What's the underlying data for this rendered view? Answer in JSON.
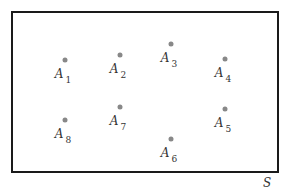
{
  "diagram": {
    "space_label": "S",
    "points": [
      {
        "id": "A1",
        "letter": "A",
        "sub": "1",
        "x": 65,
        "y": 60
      },
      {
        "id": "A2",
        "letter": "A",
        "sub": "2",
        "x": 120,
        "y": 55
      },
      {
        "id": "A3",
        "letter": "A",
        "sub": "3",
        "x": 171,
        "y": 44
      },
      {
        "id": "A4",
        "letter": "A",
        "sub": "4",
        "x": 225,
        "y": 59
      },
      {
        "id": "A5",
        "letter": "A",
        "sub": "5",
        "x": 225,
        "y": 109
      },
      {
        "id": "A6",
        "letter": "A",
        "sub": "6",
        "x": 171,
        "y": 139
      },
      {
        "id": "A7",
        "letter": "A",
        "sub": "7",
        "x": 120,
        "y": 107
      },
      {
        "id": "A8",
        "letter": "A",
        "sub": "8",
        "x": 65,
        "y": 120
      }
    ]
  }
}
